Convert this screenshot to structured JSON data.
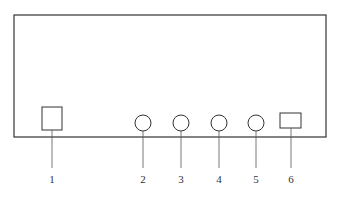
{
  "diagram": {
    "type": "front-panel schematic",
    "panel": {
      "x": 14,
      "y": 15,
      "width": 312,
      "height": 122,
      "stroke": "#333333"
    },
    "components": [
      {
        "id": "1",
        "label": "1",
        "shape": "square",
        "cx": 52,
        "cy": 118,
        "w": 20,
        "h": 23
      },
      {
        "id": "2",
        "label": "2",
        "shape": "circle",
        "cx": 143,
        "cy": 123,
        "r": 8
      },
      {
        "id": "3",
        "label": "3",
        "shape": "circle",
        "cx": 181,
        "cy": 123,
        "r": 8
      },
      {
        "id": "4",
        "label": "4",
        "shape": "circle",
        "cx": 219,
        "cy": 123,
        "r": 8
      },
      {
        "id": "5",
        "label": "5",
        "shape": "circle",
        "cx": 256,
        "cy": 123,
        "r": 8
      },
      {
        "id": "6",
        "label": "6",
        "shape": "rectangle",
        "cx": 291,
        "cy": 121,
        "w": 21,
        "h": 15
      }
    ],
    "labels": [
      "1",
      "2",
      "3",
      "4",
      "5",
      "6"
    ]
  }
}
